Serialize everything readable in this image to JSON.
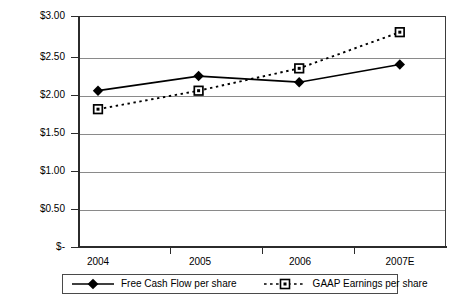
{
  "chart_data": {
    "type": "line",
    "title": "",
    "xlabel": "",
    "ylabel": "",
    "categories": [
      "2004",
      "2005",
      "2006",
      "2007E"
    ],
    "ylim": [
      0,
      3.0
    ],
    "ytick_values": [
      3.0,
      2.5,
      2.0,
      1.5,
      1.0,
      0.5,
      0
    ],
    "ytick_labels": [
      "$3.00",
      "$2.50",
      "$2.00",
      "$1.50",
      "$1.00",
      "$0.50",
      "$-"
    ],
    "grid": true,
    "legend_position": "bottom",
    "series": [
      {
        "name": "Free Cash Flow per share",
        "values": [
          2.03,
          2.22,
          2.14,
          2.37
        ],
        "marker": "diamond",
        "line_style": "solid",
        "color": "#000000"
      },
      {
        "name": "GAAP Earnings per share",
        "values": [
          1.79,
          2.03,
          2.32,
          2.79
        ],
        "marker": "square",
        "line_style": "dotted",
        "color": "#000000"
      }
    ]
  },
  "legend": {
    "items": [
      {
        "label": "Free Cash Flow per share"
      },
      {
        "label": "GAAP Earnings per share"
      }
    ]
  }
}
